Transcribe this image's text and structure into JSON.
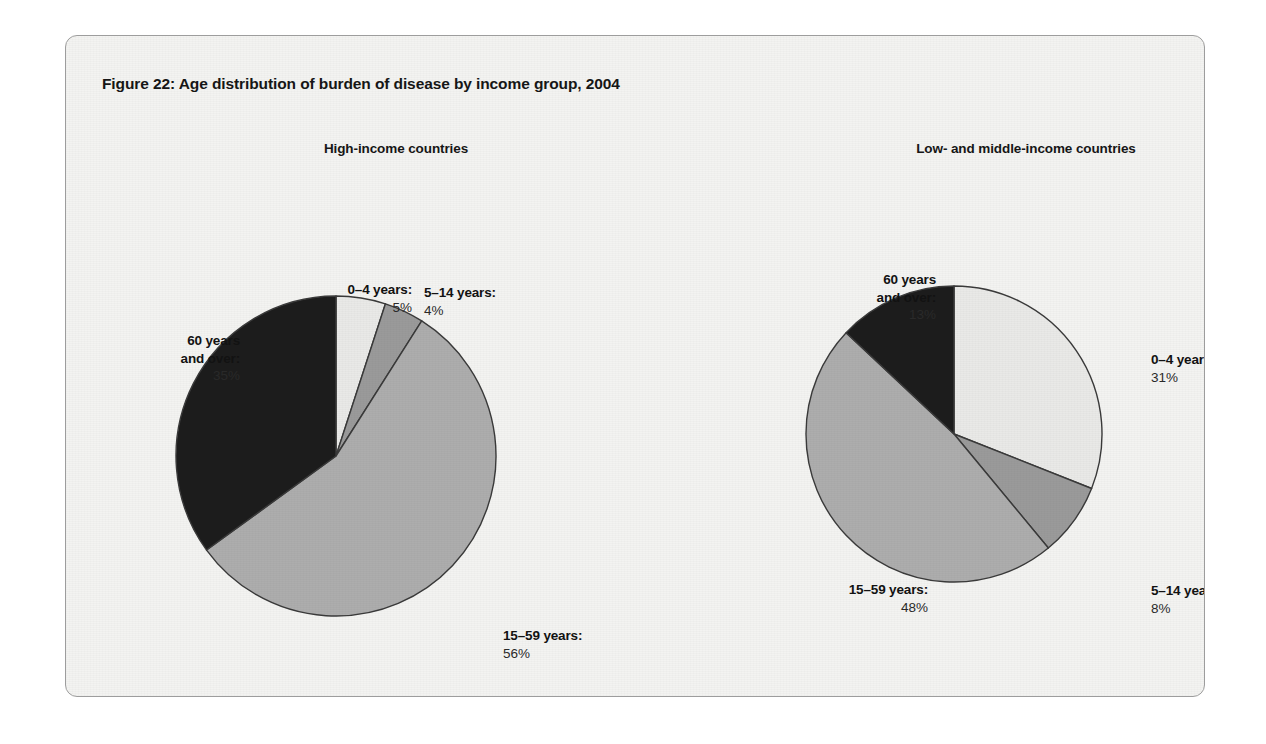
{
  "figure": {
    "title": "Figure 22: Age distribution of burden of disease by income group, 2004",
    "border_color": "#9d9d9d",
    "background_color": "#f3f3f1"
  },
  "panels": [
    {
      "title": "High-income countries"
    },
    {
      "title": "Low- and middle-income countries"
    }
  ],
  "callouts": {
    "left": {
      "age_0_4": {
        "category": "0–4 years:",
        "percent": "5%"
      },
      "age_5_14": {
        "category": "5–14 years:",
        "percent": "4%"
      },
      "age_15_59": {
        "category": "15–59 years:",
        "percent": "56%"
      },
      "age_60": {
        "category_line1": "60 years",
        "category_line2": "and over:",
        "percent": "35%"
      }
    },
    "right": {
      "age_0_4": {
        "category": "0–4 years:",
        "percent": "31%"
      },
      "age_5_14": {
        "category": "5–14 years:",
        "percent": "8%"
      },
      "age_15_59": {
        "category": "15–59 years:",
        "percent": "48%"
      },
      "age_60": {
        "category_line1": "60 years",
        "category_line2": "and over:",
        "percent": "13%"
      }
    }
  },
  "chart_data": [
    {
      "type": "pie",
      "title": "High-income countries",
      "figure_title": "Figure 22: Age distribution of burden of disease by income group, 2004",
      "categories": [
        "0–4 years",
        "5–14 years",
        "15–59 years",
        "60 years and over"
      ],
      "values": [
        5,
        4,
        56,
        35
      ],
      "unit": "%",
      "colors": [
        "#e9e9e7",
        "#9a9a9a",
        "#adadad",
        "#1c1c1c"
      ],
      "start_angle_deg": 0,
      "direction": "clockwise",
      "legend": "none (direct callout labels)",
      "stroke": "#3a3a3a"
    },
    {
      "type": "pie",
      "title": "Low- and middle-income countries",
      "figure_title": "Figure 22: Age distribution of burden of disease by income group, 2004",
      "categories": [
        "0–4 years",
        "5–14 years",
        "15–59 years",
        "60 years and over"
      ],
      "values": [
        31,
        8,
        48,
        13
      ],
      "unit": "%",
      "colors": [
        "#e9e9e7",
        "#9a9a9a",
        "#adadad",
        "#1c1c1c"
      ],
      "start_angle_deg": 0,
      "direction": "clockwise",
      "legend": "none (direct callout labels)",
      "stroke": "#3a3a3a"
    }
  ]
}
